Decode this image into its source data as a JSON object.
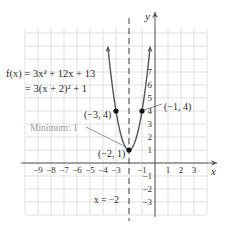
{
  "chart_data": {
    "type": "line",
    "title": "",
    "function": {
      "label_line1": "f(x) = 3x² + 12x + 13",
      "label_line2": "= 3(x + 2)² + 1"
    },
    "xlabel": "x",
    "ylabel": "y",
    "xlim": [
      -10,
      4
    ],
    "ylim": [
      -4,
      10
    ],
    "grid": true,
    "x_ticks": [
      -9,
      -8,
      -7,
      -6,
      -5,
      -4,
      -3,
      -1,
      1,
      2,
      3
    ],
    "x_tick_labels": [
      "−9",
      "−8",
      "−7",
      "−6",
      "−5",
      "−4",
      "−3",
      "−1",
      "1",
      "2",
      "3"
    ],
    "y_ticks": [
      7,
      6,
      5,
      4,
      3,
      2,
      1,
      -1,
      -2,
      -3
    ],
    "y_tick_labels": [
      "7",
      "6",
      "5",
      "4",
      "3",
      "2",
      "1",
      "−1",
      "−2",
      "−3"
    ],
    "series": [
      {
        "name": "f(x) = 3(x + 2)^2 + 1",
        "x": [
          -3.6,
          -3.5,
          -3,
          -2.5,
          -2,
          -1.5,
          -1,
          -0.5,
          -0.4
        ],
        "values": [
          8.68,
          7.75,
          4,
          1.75,
          1,
          1.75,
          4,
          7.75,
          8.68
        ]
      }
    ],
    "points": [
      {
        "x": -3,
        "y": 4,
        "label": "(−3, 4)"
      },
      {
        "x": -1,
        "y": 4,
        "label": "(−1, 4)"
      },
      {
        "x": -2,
        "y": 1,
        "label": "(−2, 1)"
      }
    ],
    "annotations": {
      "minimum": "Minimum: 1",
      "axis_of_symmetry": "x = −2",
      "axis_of_symmetry_x": -2
    },
    "colors": {
      "curve": "#555555",
      "grid": "#d9d9d9",
      "axis": "#555555",
      "points": "#111111",
      "minimum_label": "#9a9a9a"
    }
  }
}
